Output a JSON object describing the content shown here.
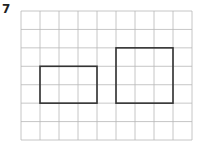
{
  "question": {
    "number": "7"
  },
  "grid": {
    "left": 21,
    "top": 11,
    "cols": 9,
    "rows": 7,
    "cell_w": 19,
    "cell_h": 18.43,
    "line_color": "#b8b8b8"
  },
  "shapes": [
    {
      "name": "left-rectangle",
      "col": 1,
      "row": 3,
      "w": 3,
      "h": 2,
      "stroke": "#333333"
    },
    {
      "name": "right-rectangle",
      "col": 5,
      "row": 2,
      "w": 3,
      "h": 3,
      "stroke": "#333333"
    }
  ]
}
